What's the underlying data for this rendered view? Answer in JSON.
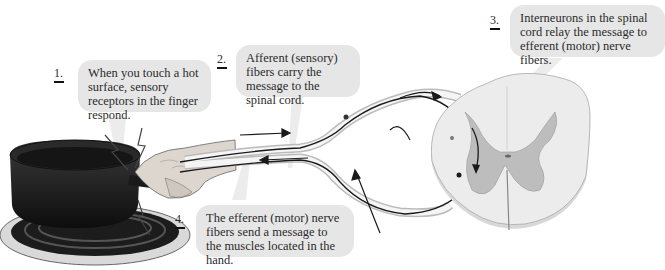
{
  "diagram": {
    "steps": [
      {
        "number": "1.",
        "text": "When you touch a hot surface, sensory receptors in the finger respond."
      },
      {
        "number": "2.",
        "text": "Afferent (sensory) fibers carry the message to the spinal cord."
      },
      {
        "number": "3.",
        "text": "Interneurons in the spinal cord relay the message to efferent (motor) nerve fibers."
      },
      {
        "number": "4.",
        "text": "The efferent (motor) nerve fibers send a message to the muscles located in the hand."
      }
    ],
    "illustration": {
      "objects": [
        "hot pan on stove burner",
        "hand touching pan handle",
        "nerve fibers",
        "spinal cord cross-section"
      ],
      "icons": [
        "lightning-bolt-icon",
        "arrow-right-icon",
        "arrow-left-icon"
      ]
    },
    "colors": {
      "bubble": "#e6e6e6",
      "text": "#2b2b2b",
      "white_matter": "#e8e8e8",
      "gray_matter": "#b9b9b9",
      "pan": "#1a1a1a",
      "nerve": "#1a1a1a"
    }
  }
}
